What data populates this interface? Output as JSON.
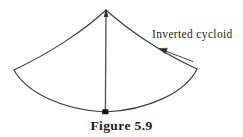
{
  "figure": {
    "caption": "Figure 5.9",
    "annotation_label": "Inverted cycloid",
    "colors": {
      "background": "#ffffff",
      "stroke": "#3a3a3a",
      "text": "#231f20",
      "caption_text": "#1a1a1a",
      "bob_fill": "#111111"
    },
    "geometry": {
      "apex": {
        "x": 106,
        "y": 10
      },
      "left_tip": {
        "x": 14,
        "y": 70
      },
      "right_tip": {
        "x": 197,
        "y": 69
      },
      "bob": {
        "x": 105,
        "y": 112
      },
      "arrow_tip": {
        "x": 160,
        "y": 49
      },
      "arrow_tail": {
        "x": 193,
        "y": 61
      }
    },
    "elements": {
      "upper_left_arc": "upper-left-cycloid-arc",
      "upper_right_arc": "upper-right-cycloid-arc",
      "lower_left_arc": "lower-left-cycloid-arc",
      "lower_right_arc": "lower-right-cycloid-arc",
      "pendulum_string": "pendulum-string",
      "pendulum_bob": "pendulum-bob",
      "leader_arrow": "leader-arrow"
    }
  }
}
